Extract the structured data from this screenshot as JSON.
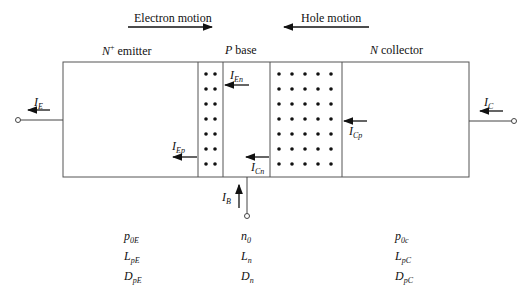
{
  "motion": {
    "electron": "Electron motion",
    "hole": "Hole motion"
  },
  "regions": {
    "emitter": {
      "sym": "N",
      "sup": "+",
      "text": " emitter"
    },
    "base": {
      "sym": "P",
      "text": " base"
    },
    "collector": {
      "sym": "N",
      "text": " collector"
    }
  },
  "currents": {
    "IE": {
      "main": "I",
      "sub": "E"
    },
    "IEn": {
      "main": "I",
      "sub": "En"
    },
    "IEp": {
      "main": "I",
      "sub": "Ep"
    },
    "ICn": {
      "main": "I",
      "sub": "Cn"
    },
    "ICp": {
      "main": "I",
      "sub": "Cp"
    },
    "IC": {
      "main": "I",
      "sub": "C"
    },
    "IB": {
      "main": "I",
      "sub": "B"
    }
  },
  "params": {
    "emitter": [
      {
        "main": "p",
        "sub": "0E"
      },
      {
        "main": "L",
        "sub": "pE"
      },
      {
        "main": "D",
        "sub": "pE"
      }
    ],
    "base": [
      {
        "main": "n",
        "sub": "0"
      },
      {
        "main": "L",
        "sub": "n"
      },
      {
        "main": "D",
        "sub": "n"
      }
    ],
    "collector": [
      {
        "main": "p",
        "sub": "0c"
      },
      {
        "main": "L",
        "sub": "pC"
      },
      {
        "main": "D",
        "sub": "pC"
      }
    ]
  }
}
